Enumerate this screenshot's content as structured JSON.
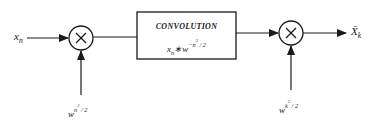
{
  "diagram": {
    "type": "block-diagram",
    "input": {
      "base": "x",
      "sub": "n"
    },
    "multiplier_left": {
      "symbol": "×",
      "factor": {
        "base": "w",
        "sup": "n",
        "sup2": "2",
        "tail": " / 2"
      }
    },
    "convolution_block": {
      "title": "CONVOLUTION",
      "expr": {
        "a_base": "x",
        "a_sub": "n",
        "op": "∗",
        "b_base": "w",
        "b_sup": "−n",
        "b_sup2": "2",
        "b_tail": " / 2"
      }
    },
    "multiplier_right": {
      "symbol": "×",
      "factor": {
        "base": "w",
        "sup": "k",
        "sup2": "2",
        "tail": " / 2"
      }
    },
    "output": {
      "base": "X̄",
      "sub": "k"
    },
    "colors": {
      "stroke": "#1a1a1a",
      "background": "#ffffff"
    }
  }
}
